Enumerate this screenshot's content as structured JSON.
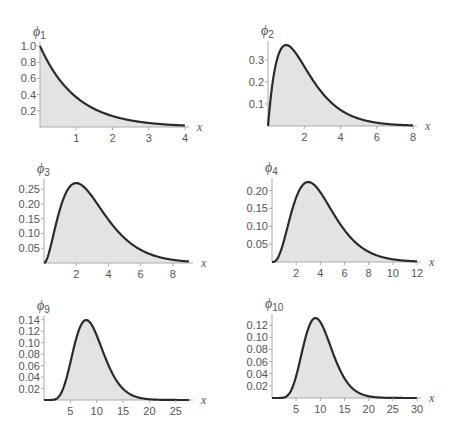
{
  "chart_data": [
    {
      "type": "area",
      "title": "φ1",
      "function": "phi_n(x) = x^(n-1) e^(-x) / (n-1)!",
      "n": 1,
      "xlabel": "x",
      "ylabel": "φ1",
      "xlim": [
        0,
        4
      ],
      "ylim": [
        0,
        1.0
      ],
      "xticks": [
        "1",
        "2",
        "3",
        "4"
      ],
      "yticks": [
        "0.2",
        "0.4",
        "0.6",
        "0.8",
        "1.0"
      ],
      "x": [
        0,
        0.5,
        1,
        1.5,
        2,
        2.5,
        3,
        3.5,
        4
      ],
      "values": [
        1.0,
        0.607,
        0.368,
        0.223,
        0.135,
        0.082,
        0.05,
        0.03,
        0.018
      ],
      "peak": {
        "x": 0,
        "y": 1.0
      },
      "grid": false,
      "fill": "light gray under curve"
    },
    {
      "type": "area",
      "title": "φ2",
      "n": 2,
      "xlabel": "x",
      "ylabel": "φ2",
      "xlim": [
        0,
        8
      ],
      "ylim": [
        0,
        0.37
      ],
      "xticks": [
        "2",
        "4",
        "6",
        "8"
      ],
      "yticks": [
        "0.1",
        "0.2",
        "0.3"
      ],
      "x": [
        0,
        1,
        2,
        3,
        4,
        5,
        6,
        7,
        8
      ],
      "values": [
        0,
        0.368,
        0.271,
        0.149,
        0.073,
        0.034,
        0.015,
        0.006,
        0.003
      ],
      "peak": {
        "x": 1,
        "y": 0.368
      },
      "grid": false
    },
    {
      "type": "area",
      "title": "φ3",
      "n": 3,
      "xlabel": "x",
      "ylabel": "φ3",
      "xlim": [
        0,
        9
      ],
      "ylim": [
        0,
        0.27
      ],
      "xticks": [
        "2",
        "4",
        "6",
        "8"
      ],
      "yticks": [
        "0.05",
        "0.10",
        "0.15",
        "0.20",
        "0.25"
      ],
      "x": [
        0,
        1,
        2,
        3,
        4,
        5,
        6,
        7,
        8,
        9
      ],
      "values": [
        0,
        0.184,
        0.271,
        0.224,
        0.147,
        0.084,
        0.045,
        0.022,
        0.011,
        0.005
      ],
      "peak": {
        "x": 2,
        "y": 0.271
      },
      "grid": false
    },
    {
      "type": "area",
      "title": "φ4",
      "n": 4,
      "xlabel": "x",
      "ylabel": "φ4",
      "xlim": [
        0,
        12
      ],
      "ylim": [
        0,
        0.224
      ],
      "xticks": [
        "2",
        "4",
        "6",
        "8",
        "10",
        "12"
      ],
      "yticks": [
        "0.05",
        "0.10",
        "0.15",
        "0.20"
      ],
      "x": [
        0,
        1,
        2,
        3,
        4,
        5,
        6,
        7,
        8,
        9,
        10,
        11,
        12
      ],
      "values": [
        0,
        0.061,
        0.18,
        0.224,
        0.195,
        0.14,
        0.089,
        0.052,
        0.029,
        0.015,
        0.008,
        0.004,
        0.002
      ],
      "peak": {
        "x": 3,
        "y": 0.224
      },
      "grid": false
    },
    {
      "type": "area",
      "title": "φ9",
      "n": 9,
      "xlabel": "x",
      "ylabel": "φ9",
      "xlim": [
        0,
        27
      ],
      "ylim": [
        0,
        0.14
      ],
      "xticks": [
        "5",
        "10",
        "15",
        "20",
        "25"
      ],
      "yticks": [
        "0.02",
        "0.04",
        "0.06",
        "0.08",
        "0.10",
        "0.12",
        "0.14"
      ],
      "x": [
        0,
        2,
        4,
        6,
        8,
        10,
        12,
        14,
        16,
        18,
        20,
        22,
        24,
        27
      ],
      "values": [
        0,
        0.0009,
        0.03,
        0.103,
        0.14,
        0.113,
        0.066,
        0.031,
        0.012,
        0.004,
        0.001,
        0.0004,
        0.0001,
        0
      ],
      "peak": {
        "x": 8,
        "y": 0.14
      },
      "grid": false
    },
    {
      "type": "area",
      "title": "φ10",
      "n": 10,
      "xlabel": "x",
      "ylabel": "φ10",
      "xlim": [
        0,
        30
      ],
      "ylim": [
        0,
        0.132
      ],
      "xticks": [
        "5",
        "10",
        "15",
        "20",
        "25",
        "30"
      ],
      "yticks": [
        "0.02",
        "0.04",
        "0.06",
        "0.08",
        "0.10",
        "0.12"
      ],
      "x": [
        0,
        2,
        4,
        6,
        8,
        9,
        10,
        12,
        14,
        16,
        18,
        20,
        24,
        30
      ],
      "values": [
        0,
        0.0002,
        0.013,
        0.069,
        0.124,
        0.132,
        0.125,
        0.087,
        0.048,
        0.022,
        0.009,
        0.003,
        0.0003,
        0
      ],
      "peak": {
        "x": 9,
        "y": 0.132
      },
      "grid": false
    }
  ],
  "panels": [
    {
      "id": "p1",
      "phi": "ϕ",
      "sub": "1",
      "n": 1,
      "xmax": 4,
      "ymax": 1.0,
      "left": 40,
      "top": 46,
      "width": 145,
      "height": 81,
      "xticks": [
        1,
        2,
        3,
        4
      ],
      "xtick_labels": [
        "1",
        "2",
        "3",
        "4"
      ],
      "yticks": [
        0.2,
        0.4,
        0.6,
        0.8,
        1.0
      ],
      "ytick_labels": [
        "0.2",
        "0.4",
        "0.6",
        "0.8",
        "1.0"
      ],
      "xlabel": "x"
    },
    {
      "id": "p2",
      "phi": "ϕ",
      "sub": "2",
      "n": 2,
      "xmax": 8,
      "ymax": 0.368,
      "left": 268,
      "top": 45,
      "width": 145,
      "height": 81,
      "xticks": [
        2,
        4,
        6,
        8
      ],
      "xtick_labels": [
        "2",
        "4",
        "6",
        "8"
      ],
      "yticks": [
        0.1,
        0.2,
        0.3
      ],
      "ytick_labels": [
        "0.1",
        "0.2",
        "0.3"
      ],
      "xlabel": "x"
    },
    {
      "id": "p3",
      "phi": "ϕ",
      "sub": "3",
      "n": 3,
      "xmax": 9,
      "ymax": 0.271,
      "left": 44,
      "top": 183,
      "width": 145,
      "height": 80,
      "xticks": [
        2,
        4,
        6,
        8
      ],
      "xtick_labels": [
        "2",
        "4",
        "6",
        "8"
      ],
      "yticks": [
        0.05,
        0.1,
        0.15,
        0.2,
        0.25
      ],
      "ytick_labels": [
        "0.05",
        "0.10",
        "0.15",
        "0.20",
        "0.25"
      ],
      "xlabel": "x"
    },
    {
      "id": "p4",
      "phi": "ϕ",
      "sub": "4",
      "n": 4,
      "xmax": 12,
      "ymax": 0.224,
      "left": 272,
      "top": 182,
      "width": 145,
      "height": 80,
      "xticks": [
        2,
        4,
        6,
        8,
        10,
        12
      ],
      "xtick_labels": [
        "2",
        "4",
        "6",
        "8",
        "10",
        "12"
      ],
      "yticks": [
        0.05,
        0.1,
        0.15,
        0.2
      ],
      "ytick_labels": [
        "0.05",
        "0.10",
        "0.15",
        "0.20"
      ],
      "xlabel": "x"
    },
    {
      "id": "p9",
      "phi": "ϕ",
      "sub": "9",
      "n": 9,
      "xmax": 27.5,
      "ymax": 0.1396,
      "left": 44,
      "top": 320,
      "width": 145,
      "height": 80,
      "xticks": [
        5,
        10,
        15,
        20,
        25
      ],
      "xtick_labels": [
        "5",
        "10",
        "15",
        "20",
        "25"
      ],
      "yticks": [
        0.02,
        0.04,
        0.06,
        0.08,
        0.1,
        0.12,
        0.14
      ],
      "ytick_labels": [
        "0.02",
        "0.04",
        "0.06",
        "0.08",
        "0.10",
        "0.12",
        "0.14"
      ],
      "xlabel": "x"
    },
    {
      "id": "p10",
      "phi": "ϕ",
      "sub": "10",
      "n": 10,
      "xmax": 30,
      "ymax": 0.1318,
      "left": 272,
      "top": 318,
      "width": 145,
      "height": 80,
      "xticks": [
        5,
        10,
        15,
        20,
        25,
        30
      ],
      "xtick_labels": [
        "5",
        "10",
        "15",
        "20",
        "25",
        "30"
      ],
      "yticks": [
        0.02,
        0.04,
        0.06,
        0.08,
        0.1,
        0.12
      ],
      "ytick_labels": [
        "0.02",
        "0.04",
        "0.06",
        "0.08",
        "0.10",
        "0.12"
      ],
      "xlabel": "x"
    }
  ],
  "colors": {
    "curve": "#2b2b2b",
    "fill": "#e3e3e3",
    "axis": "#aaaaaa",
    "text": "#555555"
  }
}
